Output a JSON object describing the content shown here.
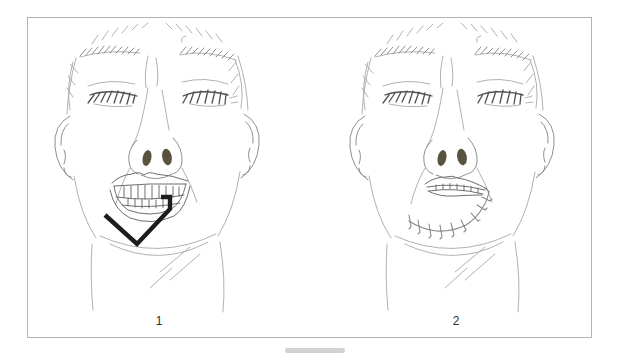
{
  "page_background": "#ffffff",
  "panel": {
    "border_color": "#b3b3b3",
    "background": "#ffffff"
  },
  "figures": [
    {
      "label": "1"
    },
    {
      "label": "2"
    }
  ],
  "scrollbar": {
    "color": "#d2d2d2"
  },
  "artwork": {
    "sketch_color": "#a8a8a8",
    "outline_color": "#8f8f8f",
    "feature_color": "#4f4f4f",
    "detail_color": "#6e6e6e",
    "incision_color": "#1d1d1d",
    "suture_color": "#8a8a8a",
    "nostril_color": "#58523f"
  }
}
